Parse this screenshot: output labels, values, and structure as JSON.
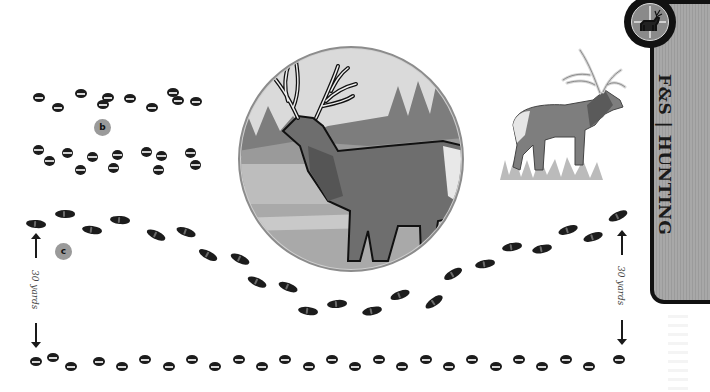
{
  "brand": {
    "tab_label": "F&S | HUNTING",
    "badge_icon": "crosshair-deer-icon",
    "colors": {
      "tab_fill": "#a3a3a3",
      "tab_border": "#111111",
      "label_circle": "#9a9a9a",
      "print": "#1c1c1c"
    }
  },
  "labels": {
    "b": "b",
    "c": "c",
    "distance_left": "30 yards",
    "distance_right": "30 yards"
  },
  "illustrations": {
    "center_medallion": "elk-in-landscape-circle",
    "right_figure": "standing-elk-on-grass"
  },
  "tracks": {
    "row_a_pairs": [
      {
        "x": 33,
        "y": 93
      },
      {
        "x": 52,
        "y": 103
      },
      {
        "x": 75,
        "y": 89
      },
      {
        "x": 97,
        "y": 100
      },
      {
        "x": 102,
        "y": 93
      },
      {
        "x": 124,
        "y": 94
      },
      {
        "x": 146,
        "y": 103
      },
      {
        "x": 167,
        "y": 88
      },
      {
        "x": 190,
        "y": 97
      },
      {
        "x": 172,
        "y": 96
      }
    ],
    "row_b_pairs": [
      {
        "x": 33,
        "y": 145
      },
      {
        "x": 44,
        "y": 156
      },
      {
        "x": 62,
        "y": 148
      },
      {
        "x": 75,
        "y": 165
      },
      {
        "x": 87,
        "y": 152
      },
      {
        "x": 112,
        "y": 150
      },
      {
        "x": 108,
        "y": 163
      },
      {
        "x": 141,
        "y": 147
      },
      {
        "x": 156,
        "y": 151
      },
      {
        "x": 153,
        "y": 165
      },
      {
        "x": 185,
        "y": 148
      },
      {
        "x": 190,
        "y": 160
      }
    ],
    "walk_steps": [
      {
        "x": 26,
        "y": 220,
        "r": 5
      },
      {
        "x": 55,
        "y": 210,
        "r": 0
      },
      {
        "x": 82,
        "y": 226,
        "r": 8
      },
      {
        "x": 110,
        "y": 216,
        "r": 5
      },
      {
        "x": 146,
        "y": 231,
        "r": 25
      },
      {
        "x": 176,
        "y": 228,
        "r": 20
      },
      {
        "x": 198,
        "y": 251,
        "r": 28
      },
      {
        "x": 230,
        "y": 255,
        "r": 25
      },
      {
        "x": 247,
        "y": 278,
        "r": 25
      },
      {
        "x": 278,
        "y": 283,
        "r": 22
      },
      {
        "x": 298,
        "y": 307,
        "r": 8
      },
      {
        "x": 327,
        "y": 300,
        "r": -5
      },
      {
        "x": 362,
        "y": 307,
        "r": -12
      },
      {
        "x": 390,
        "y": 291,
        "r": -20
      },
      {
        "x": 424,
        "y": 298,
        "r": -35
      },
      {
        "x": 443,
        "y": 270,
        "r": -30
      },
      {
        "x": 475,
        "y": 260,
        "r": -10
      },
      {
        "x": 502,
        "y": 243,
        "r": -10
      },
      {
        "x": 532,
        "y": 245,
        "r": -12
      },
      {
        "x": 558,
        "y": 226,
        "r": -18
      },
      {
        "x": 583,
        "y": 233,
        "r": -18
      },
      {
        "x": 608,
        "y": 212,
        "r": -25
      }
    ],
    "bound_row": [
      {
        "x": 30,
        "y": 357
      },
      {
        "x": 47,
        "y": 353
      },
      {
        "x": 65,
        "y": 362
      },
      {
        "x": 93,
        "y": 357
      },
      {
        "x": 116,
        "y": 362
      },
      {
        "x": 139,
        "y": 355
      },
      {
        "x": 163,
        "y": 362
      },
      {
        "x": 186,
        "y": 355
      },
      {
        "x": 209,
        "y": 362
      },
      {
        "x": 233,
        "y": 355
      },
      {
        "x": 256,
        "y": 362
      },
      {
        "x": 279,
        "y": 355
      },
      {
        "x": 303,
        "y": 362
      },
      {
        "x": 326,
        "y": 355
      },
      {
        "x": 349,
        "y": 362
      },
      {
        "x": 373,
        "y": 355
      },
      {
        "x": 396,
        "y": 362
      },
      {
        "x": 420,
        "y": 355
      },
      {
        "x": 443,
        "y": 362
      },
      {
        "x": 466,
        "y": 355
      },
      {
        "x": 490,
        "y": 362
      },
      {
        "x": 513,
        "y": 355
      },
      {
        "x": 536,
        "y": 362
      },
      {
        "x": 560,
        "y": 355
      },
      {
        "x": 583,
        "y": 362
      },
      {
        "x": 613,
        "y": 355
      }
    ]
  }
}
